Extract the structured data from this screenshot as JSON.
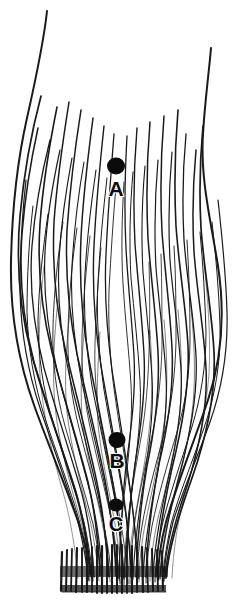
{
  "figure": {
    "background_color": "#ffffff",
    "ink_color": "#111111",
    "canvas": {
      "width": 248,
      "height": 609
    },
    "markers": [
      {
        "id": "A",
        "label": "A",
        "dot_x": 116,
        "dot_y": 166,
        "dot_rx": 9,
        "dot_ry": 8.5,
        "label_x": 116,
        "label_y": 196
      },
      {
        "id": "B",
        "label": "B",
        "dot_x": 117,
        "dot_y": 440,
        "dot_rx": 8.5,
        "dot_ry": 8,
        "label_x": 117,
        "label_y": 468
      },
      {
        "id": "C",
        "label": "C",
        "dot_x": 116,
        "dot_y": 505,
        "dot_rx": 7.5,
        "dot_ry": 6.5,
        "label_x": 116,
        "label_y": 531
      }
    ],
    "outlines": [
      {
        "name": "left-outer-edge",
        "d": "M47,11 C44,40 36,78 27,118 C18,158 12,208 11,262 C10,312 18,360 34,405 C48,444 66,487 79,524 C86,545 90,562 92,578"
      },
      {
        "name": "right-outer-edge",
        "d": "M211,48 C209,72 205,100 203,134 C200,178 211,222 218,266 C225,312 222,358 208,400 C194,442 176,486 166,522 C160,545 158,566 158,580"
      }
    ],
    "fiber_count": 46,
    "base_band": {
      "top": 548,
      "bottom": 594,
      "left": 60,
      "right": 168
    }
  },
  "meta": {
    "figure_type": "engraving",
    "label_set": [
      "A",
      "B",
      "C"
    ]
  }
}
